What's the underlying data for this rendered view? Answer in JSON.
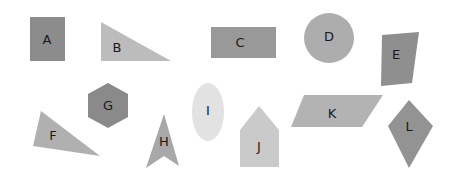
{
  "canvas": {
    "title": "geometric-shapes-figure",
    "width": 455,
    "height": 180,
    "background_color": "#ffffff"
  },
  "shapes": [
    {
      "id": "A",
      "label": "A",
      "kind": "rectangle",
      "color": "#8c8c8c",
      "label_x": 47,
      "label_y": 40,
      "geometry": "30,17 65,17 65,61 30,61"
    },
    {
      "id": "B",
      "label": "B",
      "kind": "right-triangle",
      "color": "#bcbcbc",
      "label_x": 117,
      "label_y": 48,
      "geometry": "101,22 101,61 171,61"
    },
    {
      "id": "C",
      "label": "C",
      "kind": "rectangle",
      "color": "#999999",
      "label_x": 240,
      "label_y": 43,
      "geometry": "211,27 276,27 276,58 211,58"
    },
    {
      "id": "D",
      "label": "D",
      "kind": "circle",
      "color": "#adadad",
      "label_x": 329,
      "label_y": 37,
      "geometry": "cx=329 cy=38 r=25"
    },
    {
      "id": "E",
      "label": "E",
      "kind": "quadrilateral",
      "color": "#8f8f8f",
      "label_x": 396,
      "label_y": 55,
      "geometry": "382,35 419,32 412,83 381,86"
    },
    {
      "id": "F",
      "label": "F",
      "kind": "triangle",
      "color": "#b0b0b0",
      "label_x": 53,
      "label_y": 136,
      "geometry": "41,111 33,146 100,156"
    },
    {
      "id": "G",
      "label": "G",
      "kind": "hexagon",
      "color": "#8a8a8a",
      "label_x": 108,
      "label_y": 106,
      "geometry": "108,83 128,94 128,117 108,128 88,117 88,94"
    },
    {
      "id": "H",
      "label": "H",
      "kind": "arrow-chevron",
      "color": "#a8a8a8",
      "label_x": 164,
      "label_y": 142,
      "geometry": "164,114 179,166 164,156 146,168"
    },
    {
      "id": "I",
      "label": "I",
      "kind": "ellipse",
      "color": "#e2e2e2",
      "label_x": 208,
      "label_y": 111,
      "geometry": "cx=208 cy=112 rx=16 ry=29"
    },
    {
      "id": "J",
      "label": "J",
      "kind": "pentagon",
      "color": "#cacaca",
      "label_x": 259,
      "label_y": 147,
      "geometry": "259,106 279,130 279,167 240,167 240,130"
    },
    {
      "id": "K",
      "label": "K",
      "kind": "parallelogram",
      "color": "#b3b3b3",
      "label_x": 332,
      "label_y": 114,
      "geometry": "304,95 383,95 362,127 291,127"
    },
    {
      "id": "L",
      "label": "L",
      "kind": "kite",
      "color": "#939393",
      "label_x": 409,
      "label_y": 127,
      "geometry": "409,100 433,126 409,168 388,126"
    }
  ]
}
